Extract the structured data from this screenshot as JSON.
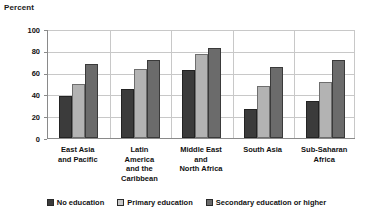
{
  "chart_data": {
    "type": "bar",
    "title": "",
    "ylabel": "Percent",
    "xlabel": "",
    "ylim": [
      0,
      100
    ],
    "yticks": [
      0,
      20,
      40,
      60,
      80,
      100
    ],
    "grid": true,
    "legend_position": "bottom",
    "categories": [
      "East Asia and Pacific",
      "Latin America and the Caribbean",
      "Middle East and North Africa",
      "South Asia",
      "Sub-Saharan Africa"
    ],
    "category_lines": [
      [
        "East Asia",
        "and Pacific"
      ],
      [
        "Latin",
        "America",
        "and the",
        "Caribbean"
      ],
      [
        "Middle East",
        "and",
        "North Africa"
      ],
      [
        "South Asia"
      ],
      [
        "Sub-Saharan",
        "Africa"
      ]
    ],
    "series": [
      {
        "name": "No education",
        "color": "#3b3b3b",
        "values": [
          39,
          45,
          62,
          27,
          34
        ]
      },
      {
        "name": "Primary education",
        "color": "#b3b3b3",
        "values": [
          50,
          63,
          77,
          48,
          51
        ]
      },
      {
        "name": "Secondary education or higher",
        "color": "#6b6b6b",
        "values": [
          68,
          72,
          83,
          65,
          72
        ]
      }
    ]
  },
  "axis": {
    "y_title": "Percent"
  }
}
